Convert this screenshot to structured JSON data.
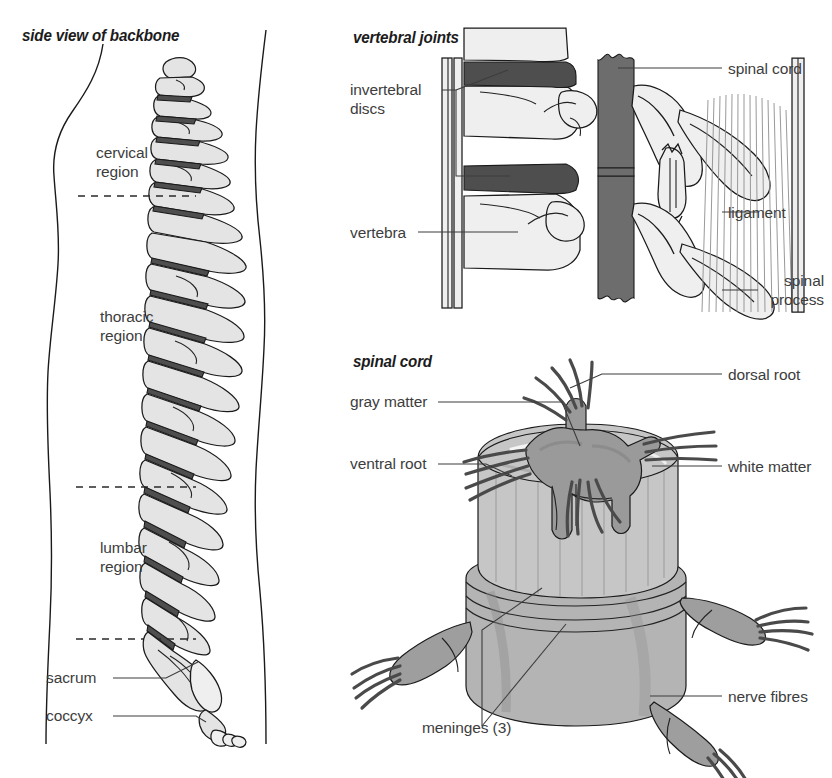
{
  "figure": {
    "kind": "anatomical-diagram"
  },
  "panels": {
    "backbone": {
      "title": "side view of backbone",
      "labels": {
        "cervical": "cervical\nregion",
        "cervical_line1": "cervical",
        "cervical_line2": "region",
        "thoracic_line1": "thoracic",
        "thoracic_line2": "region",
        "lumbar_line1": "lumbar",
        "lumbar_line2": "region",
        "sacrum": "sacrum",
        "coccyx": "coccyx"
      }
    },
    "joints": {
      "title": "vertebral joints",
      "labels": {
        "discs_line1": "invertebral",
        "discs_line2": "discs",
        "vertebra": "vertebra",
        "spinal_cord": "spinal cord",
        "ligament": "ligament",
        "spinal_process_line1": "spinal",
        "spinal_process_line2": "process"
      }
    },
    "cord": {
      "title": "spinal cord",
      "labels": {
        "gray_matter": "gray matter",
        "ventral_root": "ventral root",
        "dorsal_root": "dorsal root",
        "white_matter": "white matter",
        "meninges": "meninges (3)",
        "nerve_fibres": "nerve fibres"
      }
    }
  },
  "colors": {
    "ink": "#1a1a1a",
    "text": "#3d3d3d",
    "bone": "#e4e4e4",
    "disc": "#4e4e4e",
    "cord": "#6d6d6d",
    "gray_matter": "#9a9a9a",
    "white_matter": "#c6c6c6",
    "background": "#ffffff"
  }
}
